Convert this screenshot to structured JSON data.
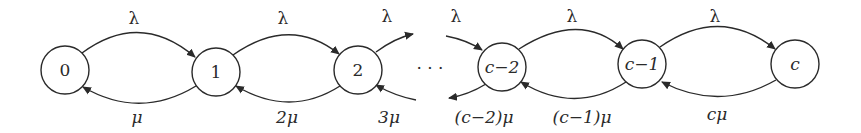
{
  "diagram": {
    "type": "birth-death-markov-chain",
    "nodes": [
      {
        "id": "0",
        "label": "0"
      },
      {
        "id": "1",
        "label": "1"
      },
      {
        "id": "2",
        "label": "2"
      },
      {
        "id": "c-2",
        "label": "c−2"
      },
      {
        "id": "c-1",
        "label": "c−1"
      },
      {
        "id": "c",
        "label": "c"
      }
    ],
    "ellipsis": "· · ·",
    "forward_edges": [
      {
        "from": "0",
        "to": "1",
        "label": "λ"
      },
      {
        "from": "1",
        "to": "2",
        "label": "λ"
      },
      {
        "from": "2",
        "to": "…",
        "label": "λ"
      },
      {
        "from": "…",
        "to": "c-2",
        "label": "λ"
      },
      {
        "from": "c-2",
        "to": "c-1",
        "label": "λ"
      },
      {
        "from": "c-1",
        "to": "c",
        "label": "λ"
      }
    ],
    "backward_edges": [
      {
        "from": "1",
        "to": "0",
        "label": "μ"
      },
      {
        "from": "2",
        "to": "1",
        "label": "2μ"
      },
      {
        "from": "…",
        "to": "2",
        "label": "3μ"
      },
      {
        "from": "c-2",
        "to": "…",
        "label": "(c−2)μ"
      },
      {
        "from": "c-1",
        "to": "c-2",
        "label": "(c−1)μ"
      },
      {
        "from": "c",
        "to": "c-1",
        "label": "cμ"
      }
    ]
  }
}
